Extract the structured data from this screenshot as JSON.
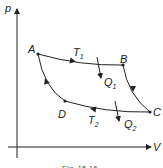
{
  "diagram": {
    "axes": {
      "y_label": "p",
      "x_label": "V"
    },
    "points": [
      {
        "name": "A",
        "label": "A"
      },
      {
        "name": "B",
        "label": "B"
      },
      {
        "name": "C",
        "label": "C"
      },
      {
        "name": "D",
        "label": "D"
      }
    ],
    "isotherms": {
      "hot": {
        "label": "T",
        "sub": "1"
      },
      "cold": {
        "label": "T",
        "sub": "2"
      }
    },
    "heat": {
      "in": {
        "label": "Q",
        "sub": "1"
      },
      "out": {
        "label": "Q",
        "sub": "2"
      }
    },
    "caption": "Fig. 15.16",
    "colors": {
      "line": "#222222",
      "background": "#ffffff"
    }
  }
}
